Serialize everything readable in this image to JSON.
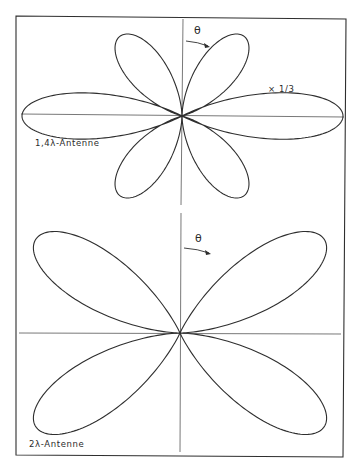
{
  "figure": {
    "frame": {
      "x1": 16,
      "y1": 17,
      "x2": 345,
      "y2": 456
    },
    "line_color": "#2e2e2e",
    "background": "#ffffff"
  },
  "panels": [
    {
      "id": "top",
      "label": "1,4λ-Antenne",
      "scale_note": "× 1/3",
      "theta_symbol": "θ",
      "antenna_length_wavelengths": 1.4,
      "center": [
        182,
        116
      ],
      "axis": {
        "h_from": 20,
        "h_to": 345,
        "v_from": 17,
        "v_to": 205
      },
      "lobes": {
        "main_radius_px": 160,
        "side_radius_px": 100,
        "main_scale": "1/3"
      }
    },
    {
      "id": "bottom",
      "label": "2λ-Antenne",
      "theta_symbol": "θ",
      "antenna_length_wavelengths": 2.0,
      "center": [
        180,
        333
      ],
      "axis": {
        "h_from": 20,
        "h_to": 341,
        "v_from": 213,
        "v_to": 456
      },
      "lobes": {
        "radius_px": 172
      }
    }
  ],
  "chart_data": [
    {
      "type": "polar",
      "title": "1,4λ-Antenne",
      "annotation": "× 1/3 (main lobes scaled)",
      "angle_label": "θ (measured clockwise from vertical axis)",
      "lobes": [
        {
          "direction_deg": 90,
          "relative_size": 1.6,
          "note": "main lobe drawn ×1/3"
        },
        {
          "direction_deg": 270,
          "relative_size": 1.6,
          "note": "main lobe drawn ×1/3"
        },
        {
          "direction_deg": 38,
          "relative_size": 1.0
        },
        {
          "direction_deg": 142,
          "relative_size": 1.0
        },
        {
          "direction_deg": 218,
          "relative_size": 1.0
        },
        {
          "direction_deg": 322,
          "relative_size": 1.0
        }
      ]
    },
    {
      "type": "polar",
      "title": "2λ-Antenne",
      "angle_label": "θ (measured clockwise from vertical axis)",
      "lobes": [
        {
          "direction_deg": 57,
          "relative_size": 1.0
        },
        {
          "direction_deg": 123,
          "relative_size": 1.0
        },
        {
          "direction_deg": 237,
          "relative_size": 1.0
        },
        {
          "direction_deg": 303,
          "relative_size": 1.0
        }
      ]
    }
  ]
}
